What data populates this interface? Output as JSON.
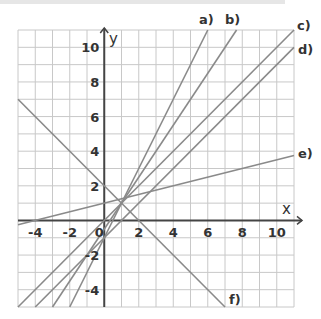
{
  "chart_data": {
    "type": "line",
    "title": "",
    "xlabel": "x",
    "ylabel": "y",
    "xlim": [
      -5,
      11
    ],
    "ylim": [
      -5,
      11
    ],
    "grid": true,
    "grid_step": 1,
    "x_ticks": [
      -4,
      -2,
      0,
      2,
      4,
      6,
      8,
      10
    ],
    "y_ticks": [
      -4,
      -2,
      2,
      4,
      6,
      8,
      10
    ],
    "series": [
      {
        "name": "a)",
        "equation": "y = 2x - 1",
        "points": [
          [
            -2,
            -5
          ],
          [
            6,
            11
          ]
        ]
      },
      {
        "name": "b)",
        "equation": "y = 1.5x - 0.5",
        "points": [
          [
            -3,
            -5
          ],
          [
            7.67,
            11
          ]
        ]
      },
      {
        "name": "c)",
        "equation": "y = x",
        "points": [
          [
            -5,
            -5
          ],
          [
            11,
            11
          ]
        ]
      },
      {
        "name": "d)",
        "equation": "y = x - 1",
        "points": [
          [
            -4,
            -5
          ],
          [
            11,
            10
          ]
        ]
      },
      {
        "name": "e)",
        "equation": "y = 0.25x + 1",
        "points": [
          [
            -5,
            -0.25
          ],
          [
            11,
            3.75
          ]
        ]
      },
      {
        "name": "f)",
        "equation": "y = -x + 2",
        "points": [
          [
            -5,
            7
          ],
          [
            7,
            -5
          ]
        ]
      }
    ],
    "legend_position": "inline labels at line ends"
  },
  "labels": {
    "x_axis": "x",
    "y_axis": "y",
    "origin": "0",
    "a": "a)",
    "b": "b)",
    "c": "c)",
    "d": "d)",
    "e": "e)",
    "f": "f)"
  },
  "colors": {
    "grid": "#c8c8c8",
    "axis": "#444444",
    "series_line": "#8a8a8a",
    "text": "#333333"
  }
}
